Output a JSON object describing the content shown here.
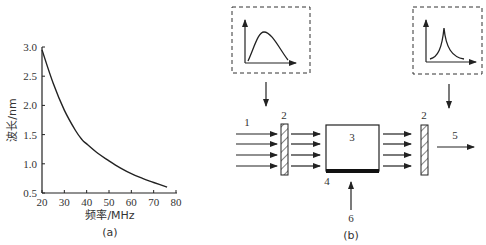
{
  "chart_data": {
    "type": "line",
    "title": "",
    "xlabel": "频率/MHz",
    "ylabel": "波长/nm",
    "caption": "(a)",
    "xlim": [
      20,
      80
    ],
    "ylim": [
      0.5,
      3.0
    ],
    "xticks": [
      "20",
      "30",
      "40",
      "50",
      "60",
      "70",
      "80"
    ],
    "yticks": [
      "0.5",
      "1.0",
      "1.5",
      "2.0",
      "2.5",
      "3.0"
    ],
    "grid": false,
    "series": [
      {
        "name": "wavelength",
        "x": [
          20,
          25,
          30,
          35,
          38,
          40,
          45,
          50,
          55,
          60,
          65,
          70,
          76
        ],
        "y": [
          2.95,
          2.38,
          1.92,
          1.57,
          1.41,
          1.34,
          1.18,
          1.05,
          0.93,
          0.83,
          0.75,
          0.68,
          0.6
        ]
      }
    ]
  },
  "diagram": {
    "caption": "(b)",
    "labels": {
      "incident_light": "1",
      "filter_left": "2",
      "filter_right": "2",
      "crystal": "3",
      "transducer": "4",
      "output_light": "5",
      "rf_input": "6"
    },
    "insets": {
      "left": "broadband-spectrum",
      "right": "narrowband-spectrum"
    }
  }
}
